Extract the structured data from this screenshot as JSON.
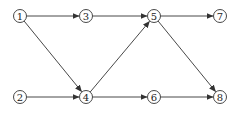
{
  "diagram": {
    "type": "directed-network",
    "colors": {
      "stroke": "#333333",
      "background": "#ffffff",
      "text": "#222222"
    },
    "nodes": [
      {
        "id": "1",
        "label": "1",
        "x": 20,
        "y": 16
      },
      {
        "id": "3",
        "label": "3",
        "x": 86,
        "y": 16
      },
      {
        "id": "5",
        "label": "5",
        "x": 154,
        "y": 16
      },
      {
        "id": "7",
        "label": "7",
        "x": 220,
        "y": 16
      },
      {
        "id": "2",
        "label": "2",
        "x": 20,
        "y": 97
      },
      {
        "id": "4",
        "label": "4",
        "x": 86,
        "y": 97
      },
      {
        "id": "6",
        "label": "6",
        "x": 154,
        "y": 97
      },
      {
        "id": "8",
        "label": "8",
        "x": 220,
        "y": 97
      }
    ],
    "edges": [
      {
        "from": "1",
        "to": "3"
      },
      {
        "from": "3",
        "to": "5"
      },
      {
        "from": "5",
        "to": "7"
      },
      {
        "from": "1",
        "to": "4"
      },
      {
        "from": "2",
        "to": "4"
      },
      {
        "from": "4",
        "to": "5"
      },
      {
        "from": "4",
        "to": "6"
      },
      {
        "from": "5",
        "to": "8"
      },
      {
        "from": "6",
        "to": "8"
      }
    ]
  }
}
